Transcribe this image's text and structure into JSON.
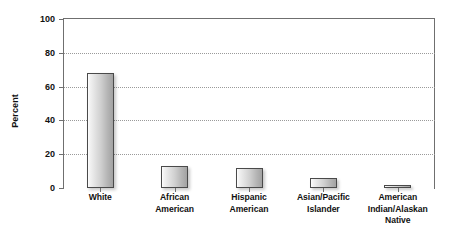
{
  "chart_data": {
    "type": "bar",
    "title": "",
    "subtitle": "",
    "xlabel": "",
    "ylabel": "Percent",
    "ylim": [
      0,
      100
    ],
    "yticks": [
      0,
      20,
      40,
      60,
      80,
      100
    ],
    "ytick_labels": [
      "0",
      "20",
      "40",
      "60",
      "80",
      "100"
    ],
    "grid": "horizontal-dotted",
    "legend": "none",
    "categories": [
      "White",
      "African American",
      "Hispanic American",
      "Asian/Pacific Islander",
      "American Indian/Alaskan Native"
    ],
    "category_lines": [
      [
        "White"
      ],
      [
        "African",
        "American"
      ],
      [
        "Hispanic",
        "American"
      ],
      [
        "Asian/Pacific",
        "Islander"
      ],
      [
        "American",
        "Indian/Alaskan",
        "Native"
      ]
    ],
    "values": [
      68,
      13,
      12,
      6,
      1
    ],
    "bar_fill_light": "#fefefe",
    "bar_fill_dark": "#a2a2a2",
    "bar_border_color": "#4a4a4a",
    "axis_color": "#6f6f6f",
    "gridline_color": "#9a9a9a",
    "text_color": "#111111",
    "background_color": "#ffffff"
  }
}
